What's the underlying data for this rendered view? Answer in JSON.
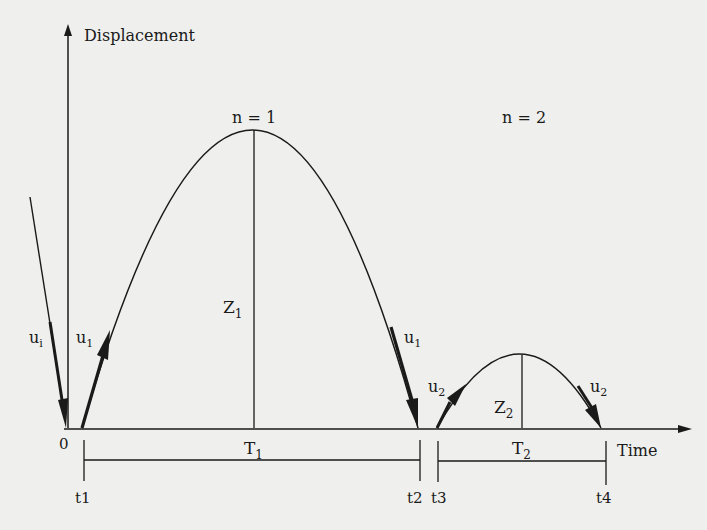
{
  "axes": {
    "y_label": "Displacement",
    "x_label": "Time",
    "origin": "0"
  },
  "bounces": [
    {
      "label": "n = 1",
      "height": "Z",
      "height_sub": "1",
      "period": "T",
      "period_sub": "1"
    },
    {
      "label": "n = 2",
      "height": "Z",
      "height_sub": "2",
      "period": "T",
      "period_sub": "2"
    }
  ],
  "velocities": {
    "incident": {
      "base": "u",
      "sub": "i"
    },
    "first_up": {
      "base": "u",
      "sub": "1"
    },
    "first_down": {
      "base": "u",
      "sub": "1"
    },
    "second_up": {
      "base": "u",
      "sub": "2"
    },
    "second_down": {
      "base": "u",
      "sub": "2"
    }
  },
  "time_marks": [
    "t1",
    "t2",
    "t3",
    "t4"
  ],
  "colors": {
    "ink": "#1a1a1a",
    "background": "#efefed"
  }
}
